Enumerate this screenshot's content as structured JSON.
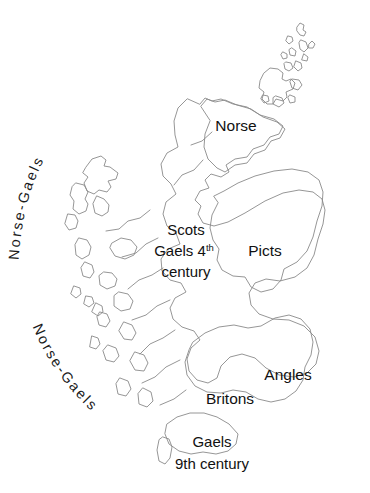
{
  "map": {
    "title": "Peoples of Early Medieval Scotland",
    "background_color": "#ffffff",
    "coastline_color": "#8a8a8a",
    "label_color": "#111111",
    "regions": [
      {
        "id": "norse",
        "label": "Norse",
        "fill": "#dedede",
        "label_x": 236,
        "label_y": 131
      },
      {
        "id": "picts",
        "label": "Picts",
        "fill": "#b9b9b9",
        "label_x": 265,
        "label_y": 256
      },
      {
        "id": "angles",
        "label": "Angles",
        "fill": "#ababab",
        "label_x": 288,
        "label_y": 380
      },
      {
        "id": "britons",
        "label": "Britons",
        "fill": "#ababab",
        "label_x": 230,
        "label_y": 404
      },
      {
        "id": "scots-gaels",
        "label_line_1": "Scots",
        "label_line_2": "Gaels 4",
        "label_superscript": "th",
        "label_line_3": "century",
        "fill": "#fbfbfb",
        "label_x": 186,
        "label_y": 235
      },
      {
        "id": "gaels-9th",
        "label_line_1": "Gaels",
        "label_line_2": "9th century",
        "fill": "#ffffff",
        "label_x": 212,
        "label_y": 447
      }
    ],
    "arc_labels": [
      {
        "id": "norse-gaels-north",
        "text": "Norse-Gaels",
        "orientation": "arc-upper-left"
      },
      {
        "id": "norse-gaels-south",
        "text": "Norse-Gaels",
        "orientation": "arc-lower-left"
      }
    ],
    "island_groups": [
      {
        "id": "shetland",
        "fill": "#dedede"
      },
      {
        "id": "orkney",
        "fill": "#dedede"
      },
      {
        "id": "outer-hebrides",
        "fill": "#e8e8e8"
      },
      {
        "id": "inner-hebrides",
        "fill": "#f0f0f0"
      }
    ]
  }
}
